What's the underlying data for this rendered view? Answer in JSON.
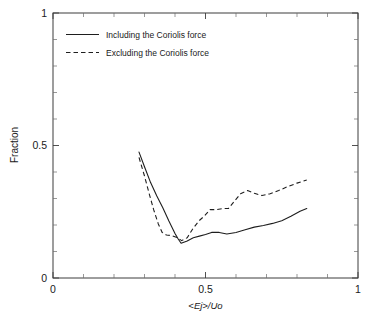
{
  "chart_data": {
    "type": "line",
    "title": "",
    "xlabel": "<Ej>/Uo",
    "ylabel": "Fraction",
    "xlim": [
      0,
      1
    ],
    "ylim": [
      0,
      1
    ],
    "xticks": [
      0,
      0.5,
      1
    ],
    "xtick_labels": [
      "0",
      "0.5",
      "1"
    ],
    "yticks": [
      0,
      0.5,
      1
    ],
    "ytick_labels": [
      "0",
      "0.5",
      "1"
    ],
    "xminor_step": 0.1,
    "yminor_step": 0.1,
    "grid": false,
    "legend_position": "upper-left-inside",
    "series": [
      {
        "name": "Including the Coriolis force",
        "style": "solid",
        "color": "#1e1e1e",
        "x": [
          0.282,
          0.3,
          0.32,
          0.34,
          0.36,
          0.38,
          0.4,
          0.41,
          0.42,
          0.44,
          0.46,
          0.48,
          0.5,
          0.52,
          0.545,
          0.57,
          0.6,
          0.63,
          0.66,
          0.69,
          0.72,
          0.75,
          0.78,
          0.81,
          0.832
        ],
        "y": [
          0.475,
          0.42,
          0.36,
          0.31,
          0.265,
          0.215,
          0.168,
          0.148,
          0.131,
          0.14,
          0.152,
          0.158,
          0.164,
          0.172,
          0.172,
          0.166,
          0.172,
          0.182,
          0.192,
          0.198,
          0.206,
          0.216,
          0.233,
          0.252,
          0.262
        ]
      },
      {
        "name": "Excluding the Coriolis force",
        "style": "dashed",
        "color": "#1e1e1e",
        "x": [
          0.282,
          0.3,
          0.315,
          0.33,
          0.345,
          0.358,
          0.372,
          0.39,
          0.408,
          0.422,
          0.44,
          0.458,
          0.478,
          0.498,
          0.515,
          0.535,
          0.555,
          0.575,
          0.595,
          0.615,
          0.638,
          0.66,
          0.685,
          0.712,
          0.74,
          0.77,
          0.8,
          0.832
        ],
        "y": [
          0.455,
          0.385,
          0.32,
          0.258,
          0.205,
          0.172,
          0.162,
          0.16,
          0.152,
          0.141,
          0.152,
          0.185,
          0.215,
          0.236,
          0.258,
          0.258,
          0.262,
          0.262,
          0.29,
          0.318,
          0.33,
          0.32,
          0.311,
          0.318,
          0.33,
          0.345,
          0.358,
          0.37
        ]
      }
    ]
  },
  "legend": {
    "entries": [
      {
        "label": "Including the Coriolis force",
        "style": "solid"
      },
      {
        "label": "Excluding the Coriolis force",
        "style": "dashed"
      }
    ]
  },
  "axes": {
    "y_axis_title": "Fraction",
    "x_axis_title": "<Ej>/Uo",
    "y_tick_top": "1",
    "y_tick_mid": "0.5",
    "y_tick_bottom": "0",
    "x_tick_left": "0",
    "x_tick_mid": "0.5",
    "x_tick_right": "1"
  },
  "colors": {
    "line": "#1e1e1e",
    "frame": "#3c3c3c",
    "text": "#1a1a1a",
    "background": "#ffffff"
  }
}
